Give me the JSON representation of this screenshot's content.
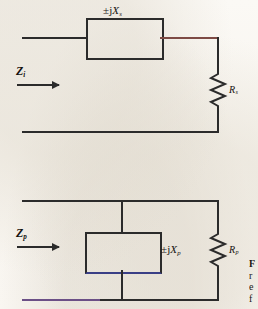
{
  "figure": {
    "paper_color": "#faf8f4",
    "ink_color": "#2b2b2b"
  },
  "circuits": [
    {
      "id": "series",
      "name": "series-equivalent-circuit",
      "input_impedance_label": "Z",
      "input_impedance_sub": "i",
      "reactance_label": "±jX",
      "reactance_sub": "s",
      "resistance_label": "R",
      "resistance_sub": "s",
      "topology": "series"
    },
    {
      "id": "parallel",
      "name": "parallel-equivalent-circuit",
      "input_impedance_label": "Z",
      "input_impedance_sub": "p",
      "reactance_label": "±jX",
      "reactance_sub": "p",
      "resistance_label": "R",
      "resistance_sub": "p",
      "topology": "parallel"
    }
  ],
  "caption": {
    "line1": "F",
    "line2": "r",
    "line3": "e",
    "line4": "f"
  }
}
